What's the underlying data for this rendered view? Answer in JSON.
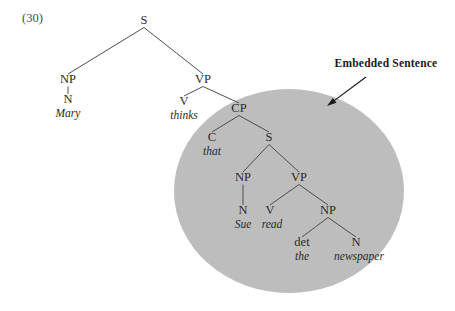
{
  "figure": {
    "example_number": "(30)",
    "callout": {
      "label": "Embedded Sentence",
      "x": 386,
      "y": 67,
      "arrow_from_x": 366,
      "arrow_from_y": 77,
      "arrow_to_x": 327,
      "arrow_to_y": 106
    },
    "highlight_ellipse": {
      "cx": 289,
      "cy": 191,
      "rx": 115,
      "ry": 102,
      "color": "#bdbdbd"
    }
  },
  "chart_data": {
    "type": "diagram",
    "sentence": "Mary thinks that Sue read the newspaper",
    "embedded_sentence": "that Sue read the newspaper",
    "nodes": [
      {
        "id": "S1",
        "label": "S",
        "x": 144,
        "y": 24,
        "kind": "category"
      },
      {
        "id": "NP1",
        "label": "NP",
        "x": 68,
        "y": 83,
        "kind": "category"
      },
      {
        "id": "N1",
        "label": "N",
        "x": 68,
        "y": 103,
        "kind": "category"
      },
      {
        "id": "W1",
        "label": "Mary",
        "x": 68,
        "y": 117,
        "kind": "word"
      },
      {
        "id": "VP1",
        "label": "VP",
        "x": 203,
        "y": 83,
        "kind": "category"
      },
      {
        "id": "V1",
        "label": "V",
        "x": 184,
        "y": 105,
        "kind": "category"
      },
      {
        "id": "W2",
        "label": "thinks",
        "x": 184,
        "y": 119,
        "kind": "word"
      },
      {
        "id": "CP",
        "label": "CP",
        "x": 239,
        "y": 112,
        "kind": "category"
      },
      {
        "id": "C1",
        "label": "C",
        "x": 212,
        "y": 141,
        "kind": "category"
      },
      {
        "id": "W3",
        "label": "that",
        "x": 212,
        "y": 155,
        "kind": "word"
      },
      {
        "id": "S2",
        "label": "S",
        "x": 269,
        "y": 141,
        "kind": "category"
      },
      {
        "id": "NP2",
        "label": "NP",
        "x": 243,
        "y": 181,
        "kind": "category"
      },
      {
        "id": "N2",
        "label": "N",
        "x": 243,
        "y": 214,
        "kind": "category"
      },
      {
        "id": "W4",
        "label": "Sue",
        "x": 243,
        "y": 228,
        "kind": "word"
      },
      {
        "id": "VP2",
        "label": "VP",
        "x": 299,
        "y": 181,
        "kind": "category"
      },
      {
        "id": "V2",
        "label": "V",
        "x": 270,
        "y": 214,
        "kind": "category"
      },
      {
        "id": "W5",
        "label": "read",
        "x": 272,
        "y": 228,
        "kind": "word"
      },
      {
        "id": "NP3",
        "label": "NP",
        "x": 328,
        "y": 214,
        "kind": "category"
      },
      {
        "id": "DET",
        "label": "det",
        "x": 302,
        "y": 246,
        "kind": "category"
      },
      {
        "id": "W6",
        "label": "the",
        "x": 302,
        "y": 260,
        "kind": "word"
      },
      {
        "id": "N3",
        "label": "N",
        "x": 356,
        "y": 246,
        "kind": "category"
      },
      {
        "id": "W7",
        "label": "newspaper",
        "x": 359,
        "y": 260,
        "kind": "word"
      }
    ],
    "edges": [
      {
        "from": "S1",
        "to": "NP1"
      },
      {
        "from": "S1",
        "to": "VP1"
      },
      {
        "from": "NP1",
        "to": "N1"
      },
      {
        "from": "VP1",
        "to": "V1"
      },
      {
        "from": "VP1",
        "to": "CP"
      },
      {
        "from": "CP",
        "to": "C1"
      },
      {
        "from": "CP",
        "to": "S2"
      },
      {
        "from": "S2",
        "to": "NP2"
      },
      {
        "from": "S2",
        "to": "VP2"
      },
      {
        "from": "NP2",
        "to": "N2"
      },
      {
        "from": "VP2",
        "to": "V2"
      },
      {
        "from": "VP2",
        "to": "NP3"
      },
      {
        "from": "NP3",
        "to": "DET"
      },
      {
        "from": "NP3",
        "to": "N3"
      }
    ]
  }
}
